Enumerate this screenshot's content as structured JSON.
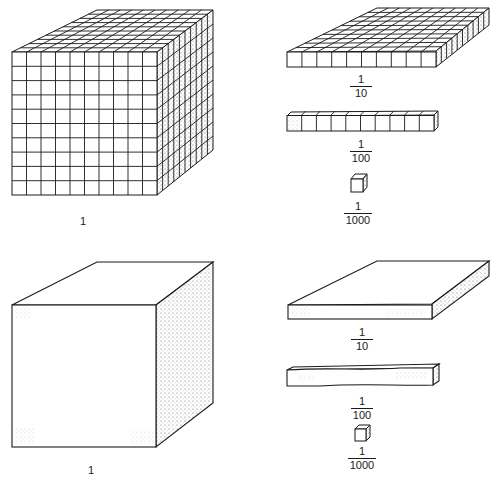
{
  "figure": {
    "stroke_color": "#1a1a1a",
    "shade_color": "#9a9a9a"
  },
  "top_row": {
    "big_cube": {
      "label": "1",
      "grid": true,
      "divisions": 10
    },
    "flat": {
      "numerator": "1",
      "denominator": "10",
      "grid": true
    },
    "rod": {
      "numerator": "1",
      "denominator": "100",
      "grid": true,
      "units": 10
    },
    "unit_cube": {
      "numerator": "1",
      "denominator": "1000"
    }
  },
  "bottom_row": {
    "big_cube": {
      "label": "1",
      "grid": false
    },
    "flat": {
      "numerator": "1",
      "denominator": "10",
      "grid": false
    },
    "rod": {
      "numerator": "1",
      "denominator": "100",
      "grid": false
    },
    "unit_cube": {
      "numerator": "1",
      "denominator": "1000"
    }
  }
}
